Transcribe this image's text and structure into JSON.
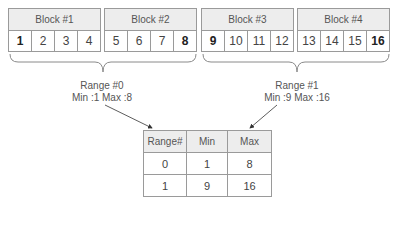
{
  "blocks": [
    {
      "label": "Block #1",
      "values": [
        "1",
        "2",
        "3",
        "4"
      ],
      "bold": [
        true,
        false,
        false,
        false
      ]
    },
    {
      "label": "Block #2",
      "values": [
        "5",
        "6",
        "7",
        "8"
      ],
      "bold": [
        false,
        false,
        false,
        true
      ]
    },
    {
      "label": "Block #3",
      "values": [
        "9",
        "10",
        "11",
        "12"
      ],
      "bold": [
        true,
        false,
        false,
        false
      ]
    },
    {
      "label": "Block #4",
      "values": [
        "13",
        "14",
        "15",
        "16"
      ],
      "bold": [
        false,
        false,
        false,
        true
      ]
    }
  ],
  "ranges": [
    {
      "title": "Range #0",
      "detail": "Min :1 Max :8"
    },
    {
      "title": "Range #1",
      "detail": "Min :9 Max :16"
    }
  ],
  "table": {
    "headers": [
      "Range#",
      "Min",
      "Max"
    ],
    "rows": [
      [
        "0",
        "1",
        "8"
      ],
      [
        "1",
        "9",
        "16"
      ]
    ]
  },
  "colors": {
    "border": "#9a9a9a",
    "header_bg": "#ededed",
    "text": "#444444"
  }
}
